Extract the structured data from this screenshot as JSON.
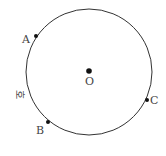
{
  "diagram": {
    "type": "circle-with-points",
    "center": {
      "label": "O",
      "x": 89,
      "y": 72
    },
    "radius": 63,
    "points": [
      {
        "label": "A",
        "x": 36,
        "y": 36
      },
      {
        "label": "B",
        "x": 48,
        "y": 122
      },
      {
        "label": "C",
        "x": 147,
        "y": 100
      }
    ],
    "arc_label": "호",
    "colors": {
      "stroke": "#333333",
      "text": "#444444"
    }
  }
}
